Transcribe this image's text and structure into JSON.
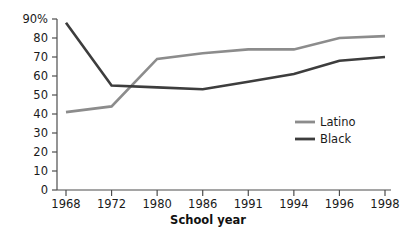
{
  "chart_data": {
    "type": "line",
    "title": "",
    "subtitle": "",
    "xlabel": "School year",
    "ylabel": "",
    "categories": [
      "1968",
      "1972",
      "1980",
      "1986",
      "1991",
      "1994",
      "1996",
      "1998"
    ],
    "ylim": [
      0,
      90
    ],
    "ytick_labels": [
      "90%",
      "80",
      "70",
      "60",
      "50",
      "40",
      "30",
      "20",
      "10",
      "0"
    ],
    "ytick_values": [
      90,
      80,
      70,
      60,
      50,
      40,
      30,
      20,
      10,
      0
    ],
    "grid": false,
    "legend_position": "inside-right",
    "series": [
      {
        "name": "Latino",
        "color": "#8c8c8c",
        "values": [
          41,
          44,
          69,
          72,
          74,
          74,
          80,
          81
        ]
      },
      {
        "name": "Black",
        "color": "#3d3d3d",
        "values": [
          88,
          55,
          54,
          53,
          57,
          61,
          68,
          70
        ]
      }
    ]
  },
  "axis": {
    "y_label_suffix_note": "90%",
    "x_title": "School year"
  },
  "legend": {
    "items": [
      {
        "label": "Latino",
        "color": "#8c8c8c"
      },
      {
        "label": "Black",
        "color": "#3d3d3d"
      }
    ]
  }
}
